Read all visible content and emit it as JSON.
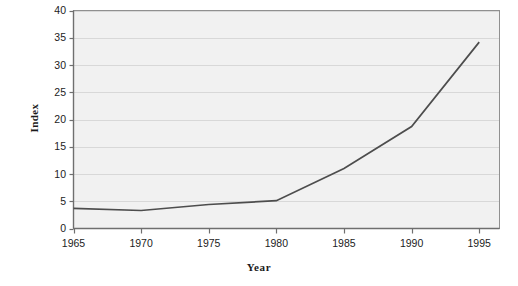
{
  "chart_data": {
    "type": "line",
    "title": "",
    "xlabel": "Year",
    "ylabel": "Index",
    "x": [
      1965,
      1970,
      1975,
      1980,
      1985,
      1990,
      1995
    ],
    "values": [
      3.7,
      3.3,
      4.4,
      5.1,
      11.0,
      18.7,
      34.2
    ],
    "series": [
      {
        "name": "Index",
        "values": [
          3.7,
          3.3,
          4.4,
          5.1,
          11.0,
          18.7,
          34.2
        ]
      }
    ],
    "xlim": [
      1965,
      1996.5
    ],
    "ylim": [
      0,
      40
    ],
    "xticks": [
      1965,
      1970,
      1975,
      1980,
      1985,
      1990,
      1995
    ],
    "xtick_labels": [
      "1965",
      "1970",
      "1975",
      "1980",
      "1985",
      "1990",
      "1995"
    ],
    "yticks": [
      0,
      5,
      10,
      15,
      20,
      25,
      30,
      35,
      40
    ],
    "ytick_labels": [
      "0",
      "5",
      "10",
      "15",
      "20",
      "25",
      "30",
      "35",
      "40"
    ],
    "grid": "horizontal",
    "legend": "none",
    "colors": {
      "line": "#4d4d4d",
      "plot_background": "#f1f1f1",
      "gridline": "#d8d8d8",
      "axis": "#8a8a8a",
      "text": "#1c1c1c"
    }
  },
  "axis_titles": {
    "y": "Index",
    "x": "Year"
  }
}
